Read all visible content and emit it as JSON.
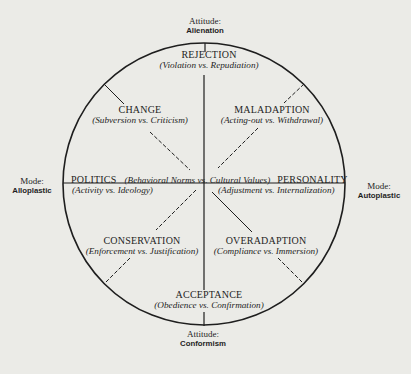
{
  "axes": {
    "top": {
      "title": "Attitude:",
      "value": "Alienation"
    },
    "bottom": {
      "title": "Attitude:",
      "value": "Conformism"
    },
    "left": {
      "title": "Mode:",
      "value": "Alloplastic"
    },
    "right": {
      "title": "Mode:",
      "value": "Autoplastic"
    }
  },
  "center_axis": {
    "left_label": "POLITICS",
    "middle_label": "(Behavioral Norms vs. Cultural Values)",
    "right_label": "PERSONALITY"
  },
  "sectors": {
    "rejection": {
      "label": "REJECTION",
      "sub": "(Violation vs. Repudiation)"
    },
    "change": {
      "label": "CHANGE",
      "sub": "(Subversion vs. Criticism)"
    },
    "maladaption": {
      "label": "MALADAPTION",
      "sub": "(Acting-out vs. Withdrawal)"
    },
    "politics_sub": {
      "sub": "(Activity vs. Ideology)"
    },
    "personality_sub": {
      "sub": "(Adjustment vs. Internalization)"
    },
    "conservation": {
      "label": "CONSERVATION",
      "sub": "(Enforcement vs. Justification)"
    },
    "overadaption": {
      "label": "OVERADAPTION",
      "sub": "(Compliance vs. Immersion)"
    },
    "acceptance": {
      "label": "ACCEPTANCE",
      "sub": "(Obedience vs. Confirmation)"
    }
  },
  "colors": {
    "background": "#ebebe7",
    "ink": "#1e1e1e"
  }
}
